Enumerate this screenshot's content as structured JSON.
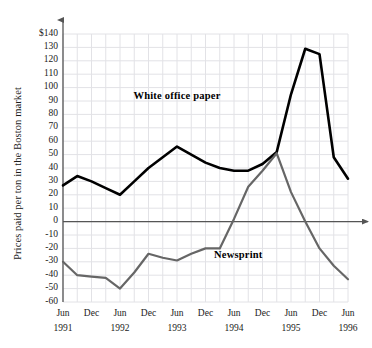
{
  "chart_data": {
    "type": "line",
    "title": "",
    "xlabel": "",
    "ylabel": "Prices paid per ton in the Boston market",
    "ylim": [
      -60,
      140
    ],
    "ytick_labels": [
      "$140",
      "130",
      "120",
      "110",
      "100",
      "90",
      "80",
      "70",
      "60",
      "50",
      "40",
      "30",
      "20",
      "10",
      "0",
      "-10",
      "-20",
      "-30",
      "-40",
      "-50",
      "-60"
    ],
    "ytick_values": [
      140,
      130,
      120,
      110,
      100,
      90,
      80,
      70,
      60,
      50,
      40,
      30,
      20,
      10,
      0,
      -10,
      -20,
      -30,
      -40,
      -50,
      -60
    ],
    "grid": true,
    "legend_position": "inline-annotation",
    "x_tick_months": [
      "Jun",
      "Dec",
      "Jun",
      "Dec",
      "Jun",
      "Dec",
      "Jun",
      "Dec",
      "Jun",
      "Dec",
      "Jun"
    ],
    "x_tick_years": [
      "1991",
      "",
      "1992",
      "",
      "1993",
      "",
      "1994",
      "",
      "1995",
      "",
      "1996"
    ],
    "x_labels": [
      "Jun 1991",
      "Dec 1991",
      "Jun 1992",
      "Dec 1992",
      "Jun 1993",
      "Dec 1993",
      "Jun 1994",
      "Dec 1994",
      "Jun 1995",
      "Dec 1995",
      "Jun 1996"
    ],
    "series": [
      {
        "name": "White office paper",
        "color": "#000000",
        "width": 2.6,
        "annotation": "White office paper",
        "x": [
          0,
          1,
          2,
          3,
          4,
          5,
          6,
          7,
          8,
          9,
          10,
          11,
          12,
          13,
          14,
          15,
          16,
          17,
          18,
          19,
          20
        ],
        "values": [
          27,
          34,
          30,
          25,
          20,
          30,
          40,
          48,
          56,
          50,
          44,
          40,
          38,
          38,
          43,
          52,
          95,
          129,
          125,
          48,
          32
        ]
      },
      {
        "name": "Newsprint",
        "color": "#666666",
        "width": 2.2,
        "annotation": "Newsprint",
        "x": [
          0,
          1,
          2,
          3,
          4,
          5,
          6,
          7,
          8,
          9,
          10,
          11,
          12,
          13,
          14,
          15,
          16,
          17,
          18,
          19,
          20
        ],
        "values": [
          -30,
          -40,
          -41,
          -42,
          -50,
          -38,
          -24,
          -27,
          -29,
          -24,
          -20,
          -20,
          2,
          26,
          38,
          51,
          22,
          0,
          -20,
          -33,
          -43
        ]
      }
    ],
    "annotations": [
      {
        "text": "White office paper",
        "x_frac": 0.4,
        "y_value": 93
      },
      {
        "text": "Newsprint",
        "x_frac": 0.615,
        "y_value": -26
      }
    ],
    "axis_arrows": [
      "y-top",
      "x-right"
    ],
    "colors": {
      "grid": "#e2e2e6",
      "axis": "#555555",
      "zero_axis": "#555555",
      "background": "#ffffff"
    }
  }
}
